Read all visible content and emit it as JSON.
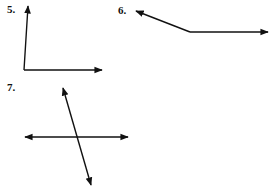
{
  "problems": [
    {
      "label": "5.",
      "label_pos": [
        7,
        3
      ],
      "figure": "angle",
      "vertex": [
        24,
        70
      ],
      "rays": [
        [
          28,
          6
        ],
        [
          102,
          70
        ]
      ]
    },
    {
      "label": "6.",
      "label_pos": [
        118,
        4
      ],
      "figure": "angle",
      "vertex": [
        190,
        32
      ],
      "rays": [
        [
          136,
          11
        ],
        [
          268,
          32
        ]
      ]
    },
    {
      "label": "7.",
      "label_pos": [
        7,
        81
      ],
      "figure": "intersecting-lines",
      "lines": [
        {
          "from": [
            25,
            137
          ],
          "to": [
            128,
            137
          ],
          "arrows": "both"
        },
        {
          "from": [
            63,
            88
          ],
          "to": [
            91,
            187
          ],
          "arrows": "both"
        }
      ]
    }
  ],
  "colors": {
    "stroke": "#111111",
    "background": "#ffffff"
  }
}
